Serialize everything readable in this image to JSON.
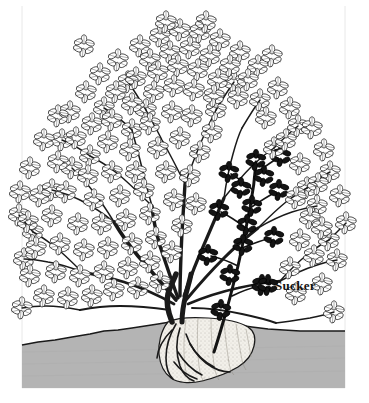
{
  "figure": {
    "canvas": {
      "width": 369,
      "height": 403
    }
  },
  "labels": [
    {
      "id": "sucker",
      "text": "Sucker",
      "x": 275,
      "y": 278
    }
  ],
  "colors": {
    "background": "#ffffff",
    "ink": "#1a1a1a",
    "soil_fill": "#b4b4b4",
    "soil_edge": "#1a1a1a",
    "rootball_fill": "#f2f0ea",
    "rootball_shade": "#cfcac0",
    "sucker_fill": "#141414",
    "frame_line": "#e2e2e2"
  },
  "soil": {
    "name": "soil-cross-section",
    "left": 22,
    "right": 345,
    "bottom": 388,
    "surface_points": "22,345 38,342 55,340 72,337 90,334 104,331 118,330 132,328 145,326 158,324 170,322 182,321 196,320 210,321 224,323 238,325 252,327 268,329 284,330 300,331 316,331 330,331 345,331",
    "surface_label": "ground line"
  },
  "rootball": {
    "name": "root-ball-cutaway",
    "center_x": 205,
    "top": 320,
    "bottom": 382
  },
  "plant": {
    "name": "shrub",
    "stem_count": 9,
    "crown_x": 178,
    "crown_y": 320,
    "canopy_top": 18,
    "canopy_left": 14,
    "canopy_right": 352,
    "leaf_cluster_count": 118,
    "sucker": {
      "name": "sucker-shoot",
      "origin_x": 215,
      "origin_y": 352,
      "tip_x": 250,
      "tip_y": 150,
      "leaf_cluster_count": 14,
      "shaded": true
    }
  }
}
